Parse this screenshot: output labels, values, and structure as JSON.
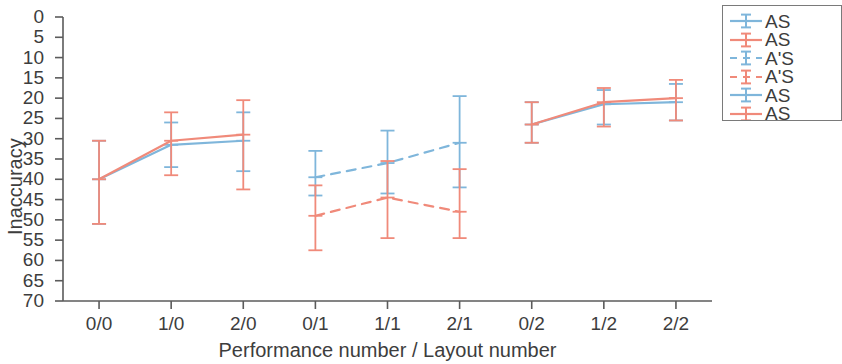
{
  "chart_data": {
    "type": "line",
    "title": "",
    "xlabel": "Performance number / Layout number",
    "ylabel": "Inaccuracy",
    "categories": [
      "0/0",
      "1/0",
      "2/0",
      "0/1",
      "1/1",
      "2/1",
      "0/2",
      "1/2",
      "2/2"
    ],
    "xtick_labels": [
      "0/0",
      "1/0",
      "2/0",
      "0/1",
      "1/1",
      "2/1",
      "0/2",
      "1/2",
      "2/2"
    ],
    "ytick_labels": [
      "0",
      "5",
      "10",
      "15",
      "20",
      "25",
      "30",
      "35",
      "40",
      "45",
      "50",
      "55",
      "60",
      "65",
      "70"
    ],
    "ytick_values": [
      0,
      5,
      10,
      15,
      20,
      25,
      30,
      35,
      40,
      45,
      50,
      55,
      60,
      65,
      70
    ],
    "ylim": [
      0,
      70
    ],
    "y_inverted": true,
    "grid": false,
    "legend_position": "right",
    "colors": {
      "blue": "#7FB6DB",
      "red": "#F08A7A",
      "axis": "#5b5b5b",
      "text": "#3d3d3d"
    },
    "series": [
      {
        "name": "AS*",
        "legend_label": "AS",
        "color": "#7FB6DB",
        "linestyle": "solid",
        "group": 1,
        "x": [
          "0/0",
          "1/0",
          "2/0"
        ],
        "values": [
          40.0,
          31.5,
          30.5
        ],
        "err_low": [
          30.5,
          26.0,
          23.5
        ],
        "err_high": [
          51.0,
          37.0,
          38.0
        ]
      },
      {
        "name": "AS",
        "legend_label": "AS",
        "color": "#F08A7A",
        "linestyle": "solid",
        "group": 1,
        "x": [
          "0/0",
          "1/0",
          "2/0"
        ],
        "values": [
          40.0,
          30.5,
          29.0
        ],
        "err_low": [
          30.5,
          23.5,
          20.5
        ],
        "err_high": [
          51.0,
          39.0,
          42.5
        ]
      },
      {
        "name": "A'S*",
        "legend_label": "A'S",
        "color": "#7FB6DB",
        "linestyle": "dashed",
        "group": 2,
        "x": [
          "0/1",
          "1/1",
          "2/1"
        ],
        "values": [
          39.5,
          36.0,
          31.0
        ],
        "err_low": [
          33.0,
          28.0,
          19.5
        ],
        "err_high": [
          44.0,
          43.5,
          42.0
        ]
      },
      {
        "name": "A'S",
        "legend_label": "A'S",
        "color": "#F08A7A",
        "linestyle": "dashed",
        "group": 2,
        "x": [
          "0/1",
          "1/1",
          "2/1"
        ],
        "values": [
          49.0,
          44.5,
          48.0
        ],
        "err_low": [
          41.5,
          35.5,
          37.5
        ],
        "err_high": [
          57.5,
          54.5,
          54.5
        ]
      },
      {
        "name": "AS*",
        "legend_label": "AS",
        "color": "#7FB6DB",
        "linestyle": "solid",
        "group": 3,
        "x": [
          "0/2",
          "1/2",
          "2/2"
        ],
        "values": [
          26.5,
          21.5,
          21.0
        ],
        "err_low": [
          21.0,
          18.0,
          16.5
        ],
        "err_high": [
          31.0,
          26.5,
          25.5
        ]
      },
      {
        "name": "AS",
        "legend_label": "AS",
        "color": "#F08A7A",
        "linestyle": "solid",
        "group": 3,
        "x": [
          "0/2",
          "1/2",
          "2/2"
        ],
        "values": [
          26.5,
          21.0,
          20.0
        ],
        "err_low": [
          21.0,
          17.5,
          15.5
        ],
        "err_high": [
          31.0,
          27.0,
          25.5
        ]
      }
    ],
    "legend_entries": [
      {
        "label": "AS",
        "color": "#7FB6DB",
        "linestyle": "solid"
      },
      {
        "label": "AS",
        "color": "#F08A7A",
        "linestyle": "solid"
      },
      {
        "label": "A'S",
        "color": "#7FB6DB",
        "linestyle": "dashed"
      },
      {
        "label": "A'S",
        "color": "#F08A7A",
        "linestyle": "dashed"
      },
      {
        "label": "AS",
        "color": "#7FB6DB",
        "linestyle": "solid"
      },
      {
        "label": "AS",
        "color": "#F08A7A",
        "linestyle": "solid"
      }
    ]
  }
}
